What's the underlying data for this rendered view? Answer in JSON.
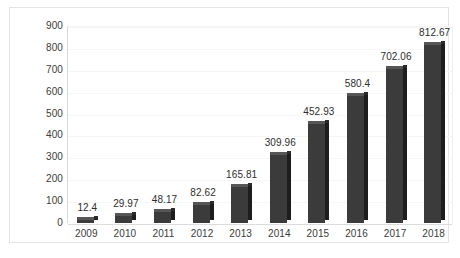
{
  "chart_data": {
    "type": "bar",
    "title": "",
    "subtitle": "",
    "xlabel": "",
    "ylabel": "",
    "categories": [
      "2009",
      "2010",
      "2011",
      "2012",
      "2013",
      "2014",
      "2015",
      "2016",
      "2017",
      "2018"
    ],
    "values": [
      12.4,
      29.97,
      48.17,
      82.62,
      165.81,
      309.96,
      452.93,
      580.4,
      702.06,
      812.67
    ],
    "data_labels": [
      "12.4",
      "29.97",
      "48.17",
      "82.62",
      "165.81",
      "309.96",
      "452.93",
      "580.4",
      "702.06",
      "812.67"
    ],
    "ylim": [
      0,
      900
    ],
    "ytick_step": 100,
    "ytick_labels": [
      "900",
      "800",
      "700",
      "600",
      "500",
      "400",
      "300",
      "200",
      "100",
      "0"
    ],
    "grid": true,
    "grid_axis": "y",
    "legend": false,
    "legend_position": "none",
    "series": [
      {
        "name": "",
        "values": [
          12.4,
          29.97,
          48.17,
          82.62,
          165.81,
          309.96,
          452.93,
          580.4,
          702.06,
          812.67
        ]
      }
    ],
    "bar_style": "3d-column",
    "colors": {
      "bar_front": "#3b3b3b",
      "bar_side": "#1d1d1d",
      "bar_top": "#565656",
      "gridline": "#f6f6f7",
      "axis": "#d9d9dc",
      "text": "#3b3b3b",
      "background": "#ffffff",
      "frame": "#e4e4e6"
    }
  }
}
